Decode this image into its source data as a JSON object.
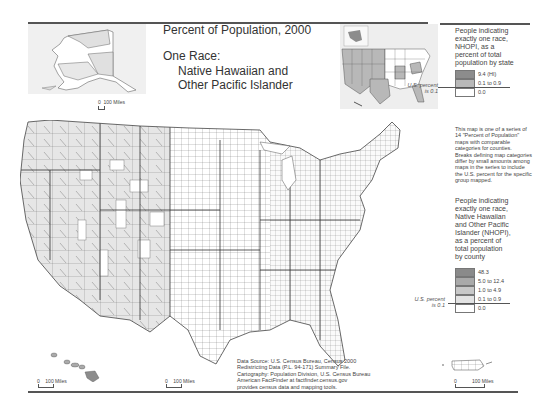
{
  "title": {
    "main": "Percent of Population, 2000",
    "line1": "One Race:",
    "line2": "Native Hawaiian and",
    "line3": "Other Pacific Islander"
  },
  "state_legend": {
    "heading": "People indicating exactly one race, NHOPI, as a percent of total population by state",
    "heading_lines": [
      "People indicating",
      "exactly one race,",
      "NHOPI, as a",
      "percent of total",
      "population by state"
    ],
    "us_percent": [
      "U.S. percent",
      "is 0.1"
    ],
    "classes": [
      {
        "label": "9.4 (HI)",
        "color": "#8c8c8c"
      },
      {
        "label": "0.1 to 0.9",
        "color": "#b8b8b8"
      },
      {
        "label": "0.0",
        "color": "#ffffff"
      }
    ]
  },
  "note": {
    "lines": [
      "This map is one of a series of",
      "14 \"Percent of Population\"",
      "maps with comparable",
      "categories for counties.",
      "Breaks defining map categories",
      "differ by small amounts among",
      "maps in the series to include",
      "the U.S. percent for the specific",
      "group mapped."
    ]
  },
  "county_legend": {
    "heading_lines": [
      "People indicating",
      "exactly one race,",
      "Native Hawaiian",
      "and Other Pacific",
      "Islander (NHOPI),",
      "as a percent of",
      "total population",
      "by county"
    ],
    "us_percent": [
      "U.S. percent",
      "is 0.1"
    ],
    "classes": [
      {
        "label": "48.3",
        "color": "#8a8a8a"
      },
      {
        "label": "5.0 to 12.4",
        "color": "#a9a9a9"
      },
      {
        "label": "1.0 to 4.9",
        "color": "#c8c8c8"
      },
      {
        "label": "0.1 to 0.9",
        "color": "#e3e3e3"
      },
      {
        "label": "0.0",
        "color": "#ffffff"
      }
    ]
  },
  "source": {
    "lines": [
      "Data Source: U.S. Census Bureau, Census 2000",
      "Redistricting Data (P.L. 94-171) Summary File.",
      "Cartography: Population Division, U.S. Census Bureau",
      "American FactFinder at factfinder.census.gov",
      "provides census data and mapping tools."
    ]
  },
  "scales": {
    "alaska": {
      "zero": "0",
      "label": "100 Miles"
    },
    "hawaii": {
      "zero": "0",
      "label": "100 Miles"
    },
    "conus": {
      "zero": "0",
      "label": "100 Miles"
    },
    "puerto_rico": {
      "zero": "0",
      "label": "100 Miles"
    }
  },
  "colors": {
    "rule": "#555555",
    "county_line": "#555555",
    "land_light": "#e6e6e6",
    "land_white": "#ffffff"
  }
}
